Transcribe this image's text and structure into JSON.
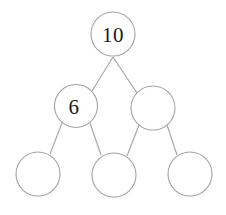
{
  "diagram": {
    "kind": "number-bond-part-whole-diagram",
    "stroke_color": "#a3a3a3",
    "fill_color": "#ffffff",
    "text_color": "#1a1a1a",
    "background_color": "#ffffff",
    "whole_label": "10",
    "rows": [
      {
        "name": "whole-row",
        "nodes": [
          {
            "id": "whole",
            "label": "10",
            "cx": 113,
            "cy": 34,
            "r": 22,
            "filled": false,
            "label_dx": 0
          }
        ]
      },
      {
        "name": "parts-row",
        "nodes": [
          {
            "id": "part-left",
            "label": "6",
            "cx": 76,
            "cy": 106,
            "r": 21.5,
            "filled": false,
            "label_dx": -2
          },
          {
            "id": "part-right",
            "label": "",
            "cx": 153,
            "cy": 108,
            "r": 22,
            "filled": false,
            "label_dx": 0
          }
        ]
      },
      {
        "name": "subparts-row",
        "nodes": [
          {
            "id": "subpart-1",
            "label": "",
            "cx": 38,
            "cy": 174,
            "r": 22,
            "filled": false,
            "label_dx": 0
          },
          {
            "id": "subpart-2",
            "label": "",
            "cx": 114,
            "cy": 175,
            "r": 22,
            "filled": false,
            "label_dx": 0
          },
          {
            "id": "subpart-3",
            "label": "",
            "cx": 190,
            "cy": 174,
            "r": 22,
            "filled": false,
            "label_dx": 0
          }
        ]
      }
    ],
    "links": [
      {
        "id": "link-whole-to-part-left",
        "x1": 113,
        "y1": 57,
        "x2": 92,
        "y2": 91
      },
      {
        "id": "link-whole-to-part-right",
        "x1": 113,
        "y1": 57,
        "x2": 137,
        "y2": 93
      },
      {
        "id": "link-part-left-to-subpart-1",
        "x1": 62,
        "y1": 123,
        "x2": 50,
        "y2": 154
      },
      {
        "id": "link-part-left-to-subpart-2",
        "x1": 90,
        "y1": 123,
        "x2": 101,
        "y2": 155
      },
      {
        "id": "link-part-right-to-subpart-2",
        "x1": 139,
        "y1": 125,
        "x2": 127,
        "y2": 156
      },
      {
        "id": "link-part-right-to-subpart-3",
        "x1": 167,
        "y1": 125,
        "x2": 177,
        "y2": 155
      }
    ]
  }
}
